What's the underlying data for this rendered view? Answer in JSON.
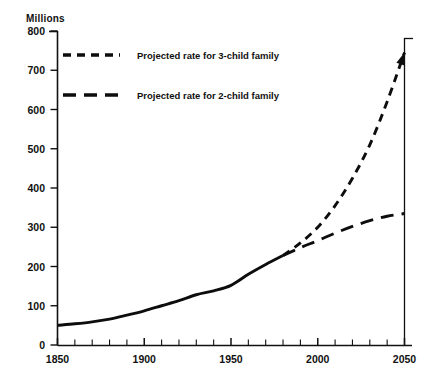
{
  "title": "POPULATION GROWTH RATES",
  "y_unit_label": "Millions",
  "legend": [
    {
      "label": "Projected rate for 3-child family",
      "style": "short-dash",
      "swatch_name": "legend-swatch-3-child"
    },
    {
      "label": "Projected rate for 2-child family",
      "style": "long-dash",
      "swatch_name": "legend-swatch-2-child"
    }
  ],
  "axis": {
    "y_ticks": [
      "0",
      "100",
      "200",
      "300",
      "400",
      "500",
      "600",
      "700",
      "800"
    ],
    "x_ticks": [
      "1850",
      "1900",
      "1950",
      "2000",
      "2050"
    ]
  },
  "chart_data": {
    "type": "line",
    "title": "POPULATION GROWTH RATES",
    "xlabel": "",
    "ylabel": "Millions",
    "xlim": [
      1850,
      2050
    ],
    "ylim": [
      0,
      800
    ],
    "y_tick_values": [
      0,
      100,
      200,
      300,
      400,
      500,
      600,
      700,
      800
    ],
    "x_tick_values": [
      1850,
      1900,
      1950,
      2000,
      2050
    ],
    "x_minor_tick_step": 10,
    "grid": false,
    "legend_position": "upper-left-inside",
    "series": [
      {
        "name": "Historical population",
        "style": "solid",
        "x": [
          1850,
          1860,
          1870,
          1880,
          1890,
          1900,
          1910,
          1920,
          1930,
          1940,
          1950,
          1960,
          1970,
          1980
        ],
        "values": [
          50,
          54,
          59,
          66,
          76,
          87,
          100,
          113,
          128,
          138,
          152,
          180,
          205,
          228
        ]
      },
      {
        "name": "Projected rate for 3-child family",
        "style": "short-dash",
        "x": [
          1980,
          1990,
          2000,
          2010,
          2020,
          2030,
          2040,
          2050
        ],
        "values": [
          228,
          260,
          300,
          355,
          425,
          510,
          620,
          745
        ]
      },
      {
        "name": "Projected rate for 2-child family",
        "style": "long-dash",
        "x": [
          1980,
          1990,
          2000,
          2010,
          2020,
          2030,
          2040,
          2050
        ],
        "values": [
          228,
          248,
          266,
          285,
          302,
          317,
          328,
          335
        ]
      }
    ]
  }
}
